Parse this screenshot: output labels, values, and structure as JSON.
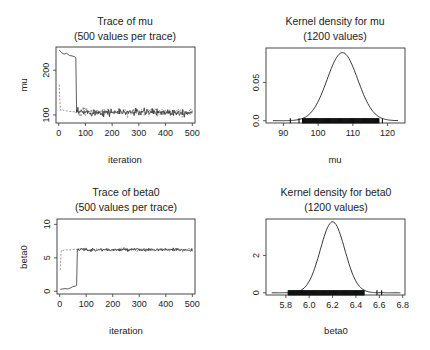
{
  "chart_data": [
    {
      "id": "trace-mu",
      "type": "line",
      "title": "Trace of mu",
      "subtitle": "(500 values per trace)",
      "xlabel": "iteration",
      "ylabel": "mu",
      "xlim": [
        -10,
        510
      ],
      "ylim": [
        82,
        252
      ],
      "xticks": [
        0,
        100,
        200,
        300,
        400,
        500
      ],
      "yticks": [
        100,
        200
      ],
      "series": [
        {
          "name": "chain 1",
          "style": "solid",
          "burnin": {
            "x": [
              2,
              10,
              20,
              30,
              40,
              50,
              60,
              64
            ],
            "y": [
              245,
              240,
              236,
              238,
              233,
              232,
              230,
              228
            ]
          },
          "jump_to": 106,
          "jump_at": 68,
          "stationary_mean": 106,
          "stationary_sd": 4
        },
        {
          "name": "chain 2",
          "style": "dashed",
          "burnin": {
            "x": [
              2,
              4,
              6,
              8,
              12,
              20,
              40,
              60
            ],
            "y": [
              168,
              140,
              115,
              110,
              112,
              110,
              108,
              107
            ]
          },
          "stationary_mean": 107,
          "stationary_sd": 4
        }
      ]
    },
    {
      "id": "density-mu",
      "type": "line",
      "title": "Kernel density for mu",
      "subtitle": "(1200 values)",
      "xlabel": "mu",
      "ylabel": "",
      "xlim": [
        85,
        125
      ],
      "ylim": [
        -0.003,
        0.095
      ],
      "xticks": [
        90,
        100,
        110,
        120
      ],
      "yticks": [
        0.0,
        0.05
      ],
      "ytick_labels": [
        "0.0",
        "0.05"
      ],
      "density": {
        "mean": 107,
        "sd": 4.4,
        "peak": 0.089,
        "range": [
          87,
          123
        ]
      },
      "rug": {
        "min": 92,
        "max": 118.5,
        "dense_range": [
          95.5,
          117.5
        ],
        "outliers": [
          92,
          94.5,
          118.5
        ]
      }
    },
    {
      "id": "trace-beta0",
      "type": "line",
      "title": "Trace of beta0",
      "subtitle": "(500 values per trace)",
      "xlabel": "iteration",
      "ylabel": "beta0",
      "xlim": [
        -10,
        510
      ],
      "ylim": [
        -0.4,
        10.8
      ],
      "xticks": [
        0,
        100,
        200,
        300,
        400,
        500
      ],
      "yticks": [
        0,
        5,
        10
      ],
      "series": [
        {
          "name": "chain 1",
          "style": "solid",
          "burnin": {
            "x": [
              2,
              10,
              20,
              30,
              40,
              50,
              60,
              64
            ],
            "y": [
              0.3,
              0.35,
              0.4,
              0.35,
              0.5,
              0.7,
              0.8,
              0.9
            ]
          },
          "jump_to": 6.2,
          "jump_at": 68,
          "stationary_mean": 6.2,
          "stationary_sd": 0.12
        },
        {
          "name": "chain 2",
          "style": "dashed",
          "burnin": {
            "x": [
              2,
              4,
              6,
              8,
              12,
              20,
              40,
              60
            ],
            "y": [
              3.2,
              4.8,
              6.0,
              6.2,
              6.1,
              6.2,
              6.2,
              6.3
            ]
          },
          "stationary_mean": 6.2,
          "stationary_sd": 0.12
        }
      ]
    },
    {
      "id": "density-beta0",
      "type": "line",
      "title": "Kernel density for beta0",
      "subtitle": "(1200 values)",
      "xlabel": "beta0",
      "ylabel": "",
      "xlim": [
        5.63,
        6.82
      ],
      "ylim": [
        -0.12,
        3.95
      ],
      "xticks": [
        5.8,
        6.0,
        6.2,
        6.4,
        6.6,
        6.8
      ],
      "xtick_labels": [
        "5.8",
        "6.0",
        "6.2",
        "6.4",
        "6.6",
        "6.8"
      ],
      "yticks": [
        0,
        2
      ],
      "ytick_labels": [
        "0",
        "2"
      ],
      "density": {
        "mean": 6.2,
        "sd": 0.105,
        "peak": 3.8,
        "range": [
          5.68,
          6.78
        ]
      },
      "rug": {
        "min": 5.82,
        "max": 6.62,
        "dense_range": [
          5.82,
          6.47
        ],
        "outliers": [
          6.58,
          6.62
        ]
      }
    }
  ]
}
